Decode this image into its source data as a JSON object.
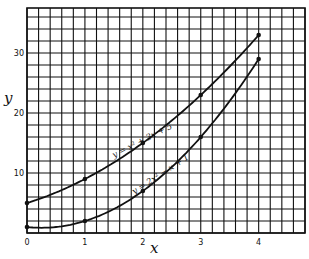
{
  "chart_data": {
    "type": "line",
    "title": "",
    "xlabel": "x",
    "ylabel": "y",
    "xlim": [
      0,
      4.8
    ],
    "ylim": [
      0,
      37.5
    ],
    "grid": true,
    "x_ticks": [
      "0",
      "1",
      "2",
      "3",
      "4"
    ],
    "y_ticks": [
      "10",
      "20",
      "30"
    ],
    "x": [
      0,
      1,
      2,
      3,
      4
    ],
    "series": [
      {
        "name": "y = x² + 3x + 5",
        "values": [
          5,
          9,
          15,
          23,
          33
        ]
      },
      {
        "name": "y = 2x² − x + 1",
        "values": [
          1,
          2,
          7,
          16,
          29
        ]
      }
    ],
    "legend_position": "inline labels along curves"
  }
}
